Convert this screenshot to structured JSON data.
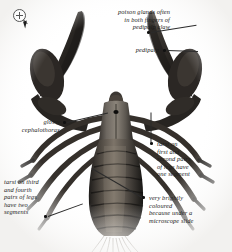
{
  "figure": {
    "background_color": "#ffffff",
    "specimen_color": "#2a2724"
  },
  "cursor": {
    "icon": "zoom-in-magnifier-icon",
    "arrow": "pointer-arrow-icon"
  },
  "annotations": [
    {
      "id": "poison-glands",
      "text": "poison glands often\nin both fingers of\npedipalp claw",
      "align": "right"
    },
    {
      "id": "pedipalp",
      "text": "pedipalp",
      "align": "right"
    },
    {
      "id": "glossy-cephalothorax",
      "text": "glossy\ncephalothorax",
      "align": "right"
    },
    {
      "id": "tarsi-first-second",
      "text": "tarsi on\nfirst and\nsecond pairs\nof legs have\none segment",
      "align": "left"
    },
    {
      "id": "tarsi-third-fourth",
      "text": "tarsi on third\nand fourth\npairs of legs\nhave two\nsegments",
      "align": "left"
    },
    {
      "id": "brightly-coloured",
      "text": "very brightly\ncoloured\nbecause under a\nmicroscope slide",
      "align": "left"
    }
  ]
}
